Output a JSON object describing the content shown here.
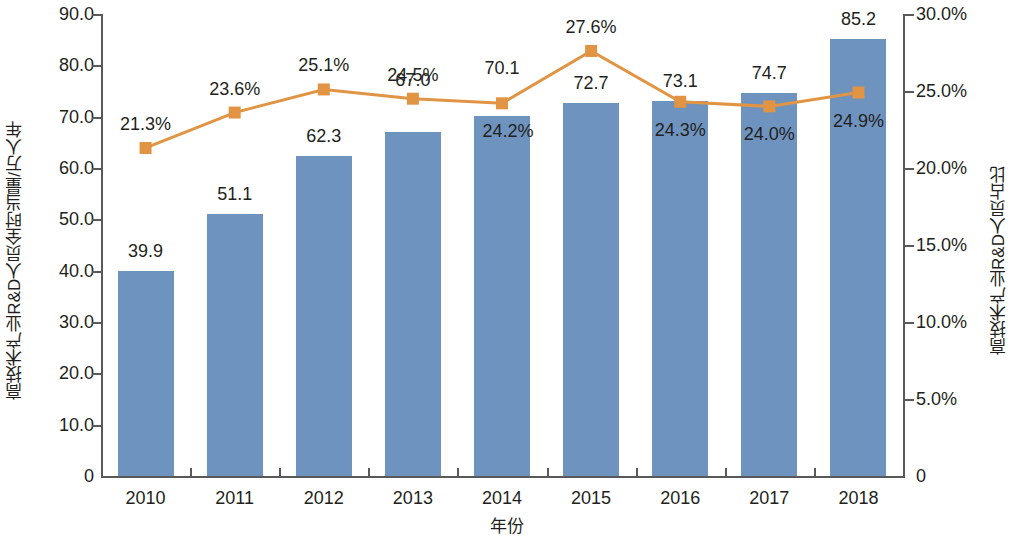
{
  "chart_data": {
    "type": "bar",
    "title": "",
    "subtitle": "",
    "xlabel": "年份",
    "ylabel": "高技术产业R&D人员全时当量/万人年",
    "y2label": "高技术产业R&D人员占比",
    "categories": [
      "2010",
      "2011",
      "2012",
      "2013",
      "2014",
      "2015",
      "2016",
      "2017",
      "2018"
    ],
    "ylim": [
      0,
      90
    ],
    "y2lim": [
      0,
      30
    ],
    "grid": false,
    "legend": "none",
    "y_ticks": [
      "0",
      "10.0",
      "20.0",
      "30.0",
      "40.0",
      "50.0",
      "60.0",
      "70.0",
      "80.0",
      "90.0"
    ],
    "y_tick_values": [
      0,
      10,
      20,
      30,
      40,
      50,
      60,
      70,
      80,
      90
    ],
    "y2_ticks": [
      "0",
      "5.0%",
      "10.0%",
      "15.0%",
      "20.0%",
      "25.0%",
      "30.0%"
    ],
    "y2_tick_values": [
      0,
      5,
      10,
      15,
      20,
      25,
      30
    ],
    "series": [
      {
        "name": "高技术产业R&D人员全时当量/万人年",
        "type": "bar",
        "axis": "left",
        "color": "#6e93bf",
        "values": [
          39.9,
          51.1,
          62.3,
          67.0,
          70.1,
          72.7,
          73.1,
          74.7,
          85.2
        ],
        "labels": [
          "39.9",
          "51.1",
          "62.3",
          "67.0",
          "70.1",
          "72.7",
          "73.1",
          "74.7",
          "85.2"
        ]
      },
      {
        "name": "高技术产业R&D人员占比",
        "type": "line",
        "axis": "right",
        "color": "#e09444",
        "marker": "square",
        "values": [
          21.3,
          23.6,
          25.1,
          24.5,
          24.2,
          27.6,
          24.3,
          24.0,
          24.9
        ],
        "labels": [
          "21.3%",
          "23.6%",
          "25.1%",
          "24.5%",
          "24.2%",
          "27.6%",
          "24.3%",
          "24.0%",
          "24.9%"
        ]
      }
    ]
  },
  "layout": {
    "bar_label_offsets_px": [
      -30,
      -30,
      -30,
      -62,
      -58,
      -30,
      -30,
      -30,
      -30
    ],
    "pct_label_positions": [
      "above",
      "above",
      "above",
      "above",
      "below",
      "above",
      "below",
      "below",
      "below"
    ],
    "pct_label_dx": [
      0,
      0,
      0,
      0,
      6,
      0,
      0,
      0,
      0
    ]
  }
}
